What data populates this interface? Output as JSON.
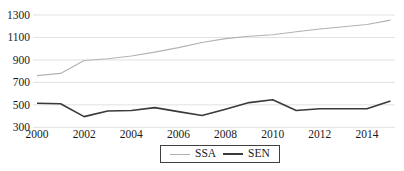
{
  "chart_data": {
    "type": "line",
    "x": [
      2000,
      2001,
      2002,
      2003,
      2004,
      2005,
      2006,
      2007,
      2008,
      2009,
      2010,
      2011,
      2012,
      2013,
      2014,
      2015
    ],
    "series": [
      {
        "name": "SSA",
        "color": "#b2b2b2",
        "width": 1.1,
        "values": [
          760,
          780,
          895,
          910,
          935,
          970,
          1010,
          1055,
          1090,
          1110,
          1125,
          1150,
          1175,
          1195,
          1215,
          1255
        ]
      },
      {
        "name": "SEN",
        "color": "#3a3a3a",
        "width": 1.6,
        "values": [
          515,
          510,
          395,
          445,
          450,
          475,
          440,
          405,
          460,
          520,
          545,
          450,
          465,
          465,
          465,
          535
        ]
      }
    ],
    "title": "",
    "xlabel": "",
    "ylabel": "",
    "xlim": [
      2000,
      2015
    ],
    "ylim": [
      300,
      1300
    ],
    "x_ticks": [
      2000,
      2002,
      2004,
      2006,
      2008,
      2010,
      2012,
      2014
    ],
    "y_ticks": [
      300,
      500,
      700,
      900,
      1100,
      1300
    ],
    "grid": true,
    "gridline_color": "#d9d9d9",
    "tick_font_size": 11.5,
    "legend_position": "bottom-center"
  },
  "legend": {
    "items": [
      {
        "label": "SSA",
        "color": "#b2b2b2",
        "sample_thickness": 1.5
      },
      {
        "label": "SEN",
        "color": "#3a3a3a",
        "sample_thickness": 2
      }
    ]
  }
}
